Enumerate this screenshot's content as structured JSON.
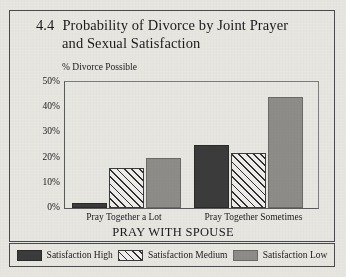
{
  "figure": {
    "number": "4.4",
    "title_line1": "Probability of Divorce by Joint Prayer",
    "title_line2": "and Sexual Satisfaction"
  },
  "legend": {
    "items": [
      {
        "label": "Satisfaction High",
        "swatch": "solid-dark-swatch",
        "color": "#3b3b3b"
      },
      {
        "label": "Satisfaction Medium",
        "swatch": "diagonal-hatch-swatch",
        "color": "#2f2f2f"
      },
      {
        "label": "Satisfaction Low",
        "swatch": "solid-gray-swatch",
        "color": "#8e8d8a"
      }
    ]
  },
  "chart_data": {
    "type": "bar",
    "ylabel": "% Divorce Possible",
    "xlabel": "PRAY WITH SPOUSE",
    "categories": [
      "Pray Together a Lot",
      "Pray Together Sometimes"
    ],
    "series": [
      {
        "name": "Satisfaction High",
        "values": [
          2,
          25
        ]
      },
      {
        "name": "Satisfaction Medium",
        "values": [
          16,
          22
        ]
      },
      {
        "name": "Satisfaction Low",
        "values": [
          20,
          44
        ]
      }
    ],
    "ylim": [
      0,
      50
    ],
    "yticks": [
      0,
      10,
      20,
      30,
      40,
      50
    ],
    "ytick_labels": [
      "0%",
      "10%",
      "20%",
      "30%",
      "40%",
      "50%"
    ],
    "grid": false,
    "legend_position": "bottom"
  }
}
